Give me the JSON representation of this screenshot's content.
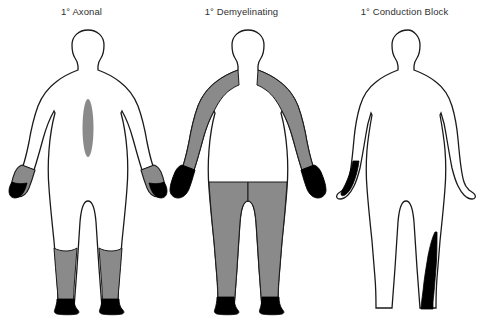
{
  "figure": {
    "kind": "medical-illustration",
    "background_color": "#ffffff",
    "outline_color": "#1a1a1a",
    "shade_gray": "#8a8a8a",
    "shade_black": "#000000",
    "panels": [
      {
        "id": "axonal",
        "title": "1° Axonal",
        "regions": [
          {
            "name": "mid-back-spindle",
            "shade": "gray"
          },
          {
            "name": "left-hand",
            "shade": "gray"
          },
          {
            "name": "left-fingers",
            "shade": "black"
          },
          {
            "name": "right-hand",
            "shade": "gray"
          },
          {
            "name": "right-fingers",
            "shade": "black"
          },
          {
            "name": "left-lower-leg",
            "shade": "gray"
          },
          {
            "name": "right-lower-leg",
            "shade": "gray"
          },
          {
            "name": "left-foot",
            "shade": "black"
          },
          {
            "name": "right-foot",
            "shade": "black"
          }
        ]
      },
      {
        "id": "demyelinating",
        "title": "1° Demyelinating",
        "regions": [
          {
            "name": "left-full-arm",
            "shade": "gray"
          },
          {
            "name": "right-full-arm",
            "shade": "gray"
          },
          {
            "name": "left-hand",
            "shade": "black"
          },
          {
            "name": "right-hand",
            "shade": "black"
          },
          {
            "name": "left-full-leg",
            "shade": "gray"
          },
          {
            "name": "right-full-leg",
            "shade": "gray"
          },
          {
            "name": "left-foot",
            "shade": "black"
          },
          {
            "name": "right-foot",
            "shade": "black"
          }
        ]
      },
      {
        "id": "conduction-block",
        "title": "1° Conduction Block",
        "regions": [
          {
            "name": "left-forearm-strip",
            "shade": "black"
          },
          {
            "name": "right-lower-leg-strip",
            "shade": "black"
          }
        ]
      }
    ]
  }
}
